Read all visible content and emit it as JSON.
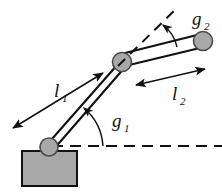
{
  "figure": {
    "labels": {
      "link1_main": "l",
      "link1_sub": "1",
      "link2_main": "l",
      "link2_sub": "2",
      "angle1_main": "g",
      "angle1_sub": "1",
      "angle2_main": "g",
      "angle2_sub": "2"
    },
    "colors": {
      "stroke": "#111111",
      "joint_fill": "#a8a8a8",
      "joint_stroke": "#4a4a4a",
      "base_fill": "#a8a8a8",
      "background": "#ffffff"
    },
    "elements": {
      "base_label": "base-platform",
      "base_joint_label": "shoulder-joint",
      "elbow_joint_label": "elbow-joint",
      "end_joint_label": "end-effector-joint",
      "link1_label": "link-1-bar",
      "link2_label": "link-2-bar",
      "baseline_label": "horizontal-reference-dashed-line",
      "extension_label": "link1-extension-dashed-line",
      "arc1_label": "angle-g1-arc",
      "arc2_label": "angle-g2-arc",
      "dim1_label": "length-l1-dimension-arrow",
      "dim2_label": "length-l2-dimension-arrow"
    },
    "geometry": {
      "shoulder": [
        48,
        146
      ],
      "elbow": [
        122,
        62
      ],
      "tip": [
        202,
        42
      ],
      "base_rect": [
        22,
        151,
        55,
        35
      ],
      "baseline_y": 146,
      "baseline_x_end": 222
    }
  }
}
